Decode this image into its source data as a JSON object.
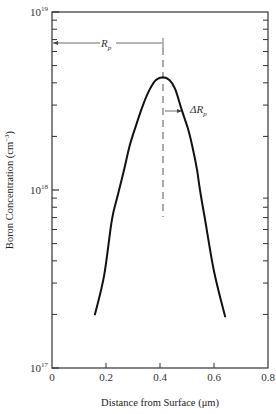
{
  "chart_data": {
    "type": "line",
    "title": "",
    "xlabel": "Distance from Surface (μm)",
    "ylabel": "Boron Concentration (cm⁻³)",
    "xlim": [
      0,
      0.8
    ],
    "ylim": [
      1e+17,
      1e+19
    ],
    "yscale": "log",
    "grid": false,
    "legend": null,
    "x_ticks": [
      0,
      0.2,
      0.4,
      0.6,
      0.8
    ],
    "x_tick_labels": [
      "0",
      "0.2",
      "0.4",
      "0.6",
      "0.8"
    ],
    "y_ticks": [
      1e+17,
      1e+18,
      1e+19
    ],
    "y_tick_labels": [
      {
        "base": "10",
        "exp": "17"
      },
      {
        "base": "10",
        "exp": "18"
      },
      {
        "base": "10",
        "exp": "19"
      }
    ],
    "series": [
      {
        "name": "Boron implant profile",
        "x": [
          0.159,
          0.193,
          0.222,
          0.244,
          0.267,
          0.289,
          0.311,
          0.337,
          0.363,
          0.385,
          0.411,
          0.435,
          0.456,
          0.481,
          0.504,
          0.522,
          0.537,
          0.548,
          0.567,
          0.6,
          0.641
        ],
        "y": [
          2e+17,
          3.3e+17,
          6.8e+17,
          9.4e+17,
          1.3e+18,
          1.8e+18,
          2.3e+18,
          3e+18,
          3.7e+18,
          4.15e+18,
          4.3e+18,
          4.15e+18,
          3.7e+18,
          2.8e+18,
          2.2e+18,
          1.7e+18,
          1.3e+18,
          1e+18,
          6.8e+17,
          3.5e+17,
          1.95e+17
        ]
      }
    ],
    "annotations": [
      {
        "text": "R",
        "subscript": "p",
        "type": "horizontal-arrow",
        "from_x": 0,
        "to_x": 0.41,
        "at_y": 6e+18,
        "description": "Projected range Rp ≈ 0.41 μm"
      },
      {
        "text": "ΔR",
        "subscript": "p",
        "type": "horizontal-arrow",
        "from_x": 0.41,
        "to_x": 0.48,
        "at_y": 2.9e+18,
        "description": "Straggle ΔRp ≈ 0.07 μm"
      },
      {
        "type": "dashed-vertical-line",
        "x": 0.41,
        "from_y": 7e+18,
        "to_y": 7e+17
      }
    ],
    "peak": {
      "x": 0.41,
      "y": 4.3e+18
    },
    "Rp": 0.41,
    "delta_Rp": 0.07
  },
  "labels": {
    "xlabel": "Distance from Surface (μm)",
    "ylabel": "Boron Concentration (cm",
    "ylabel_exp": "−3",
    "ylabel_close": ")",
    "rp_main": "R",
    "rp_sub": "p",
    "drp_main": "ΔR",
    "drp_sub": "p"
  },
  "style": {
    "curve_color": "#111111",
    "axis_color": "#333333",
    "dash_color": "#555555"
  }
}
